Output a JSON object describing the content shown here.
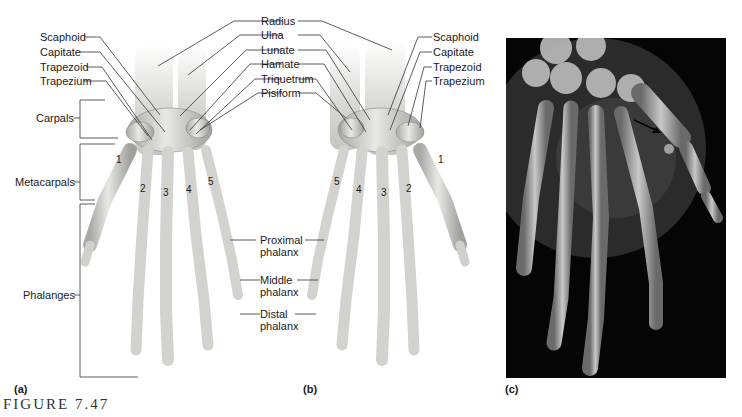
{
  "figure": {
    "title": "FIGURE 7.47",
    "panels": [
      {
        "id": "a",
        "label": "(a)"
      },
      {
        "id": "b",
        "label": "(b)"
      },
      {
        "id": "c",
        "label": "(c)"
      }
    ]
  },
  "panel_a": {
    "left_labels": [
      "Scaphoid",
      "Capitate",
      "Trapezoid",
      "Trapezium"
    ],
    "groups": [
      "Carpals",
      "Metacarpals",
      "Phalanges"
    ],
    "metacarpal_numbers": [
      "1",
      "2",
      "3",
      "4",
      "5"
    ]
  },
  "center_labels": [
    "Radius",
    "Ulna",
    "Lunate",
    "Hamate",
    "Triquetrum",
    "Pisiform"
  ],
  "phalanx_labels": [
    {
      "line1": "Proximal",
      "line2": "phalanx"
    },
    {
      "line1": "Middle",
      "line2": "phalanx"
    },
    {
      "line1": "Distal",
      "line2": "phalanx"
    }
  ],
  "panel_b": {
    "right_labels": [
      "Scaphoid",
      "Capitate",
      "Trapezoid",
      "Trapezium"
    ],
    "metacarpal_numbers": [
      "5",
      "4",
      "3",
      "2",
      "1"
    ]
  },
  "panel_c": {
    "description": "X-ray radiograph of hand with arrow pointing to sesamoid bone near thumb",
    "arrow": "arrow-pointer"
  },
  "colors": {
    "bone": "#d9d9d6",
    "bone_shadow": "#9a9a96",
    "leader_line": "#333333",
    "xray_background": "#050505"
  }
}
